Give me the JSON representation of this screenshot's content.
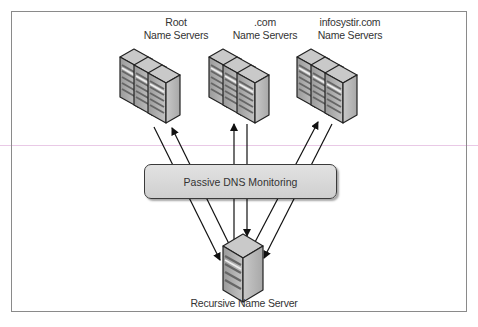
{
  "diagram": {
    "clusters": [
      {
        "id": "root",
        "line1": "Root",
        "line2": "Name Servers",
        "cx": 176
      },
      {
        "id": "com",
        "line1": ".com",
        "line2": "Name Servers",
        "cx": 265
      },
      {
        "id": "infosystir",
        "line1": "infosystir.com",
        "line2": "Name Servers",
        "cx": 348
      }
    ],
    "monitor": {
      "label": "Passive DNS Monitoring"
    },
    "recursive": {
      "label": "Recursive Name Server"
    },
    "edges": [
      {
        "from": "Recursive Name Server",
        "to": "Root Name Servers",
        "direction": "up"
      },
      {
        "from": "Root Name Servers",
        "to": "Recursive Name Server",
        "direction": "down"
      },
      {
        "from": "Recursive Name Server",
        "to": ".com Name Servers",
        "direction": "up"
      },
      {
        "from": ".com Name Servers",
        "to": "Recursive Name Server",
        "direction": "down"
      },
      {
        "from": "Recursive Name Server",
        "to": "infosystir.com Name Servers",
        "direction": "up"
      },
      {
        "from": "infosystir.com Name Servers",
        "to": "Recursive Name Server",
        "direction": "down"
      }
    ],
    "colors": {
      "frame": "#8a8a8a",
      "server_face": "#b9b9b9",
      "monitor_fill": "#d9d9d9",
      "guide_line": "#e9c9e6"
    }
  }
}
